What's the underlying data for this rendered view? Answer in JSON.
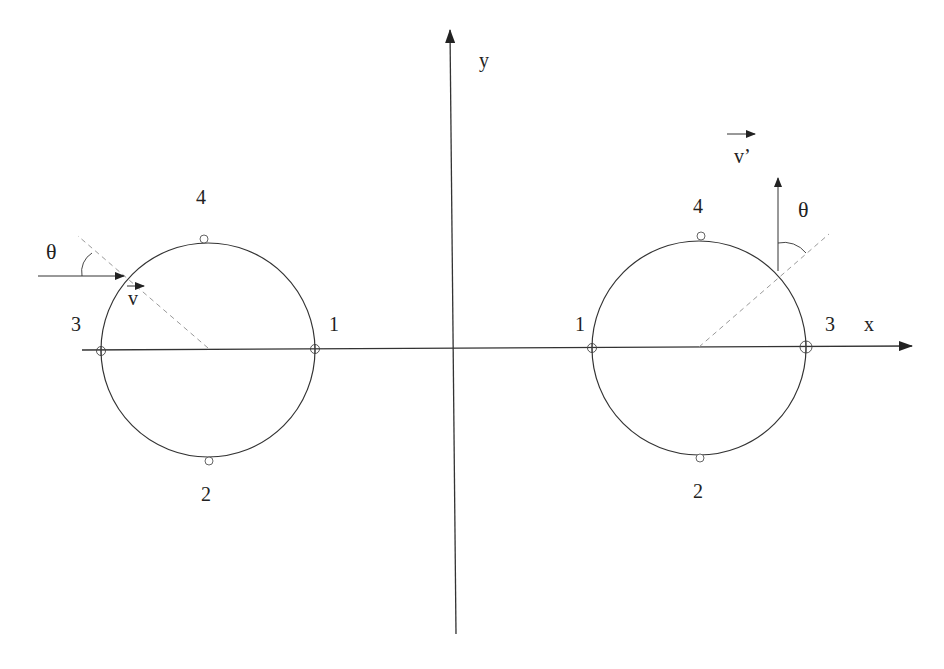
{
  "diagram": {
    "type": "coordinate diagram",
    "colors": {
      "stroke": "#333333",
      "dashed": "#9a9a9a",
      "background": "#ffffff"
    },
    "axes": {
      "x_label": "x",
      "y_label": "y"
    },
    "left_circle": {
      "points": {
        "p1": "1",
        "p2": "2",
        "p3": "3",
        "p4": "4"
      },
      "angle_label": "θ",
      "vector_label": "v"
    },
    "right_circle": {
      "points": {
        "p1": "1",
        "p2": "2",
        "p3": "3",
        "p4": "4"
      },
      "angle_label": "θ",
      "vector_label": "v’"
    }
  }
}
